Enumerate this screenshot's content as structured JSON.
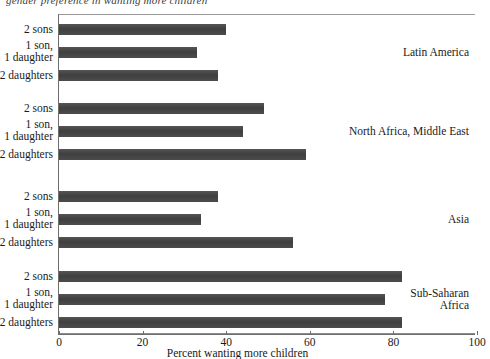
{
  "figure": {
    "top_caption": "gender preference in wanting more children",
    "x_axis_title": "Percent wanting more children",
    "x_ticks": [
      0,
      20,
      40,
      60,
      80,
      100
    ],
    "bar_color": "#4a4a4a",
    "frame_color": "#8c8c8c"
  },
  "chart_data": {
    "type": "bar",
    "orientation": "horizontal",
    "title": "",
    "xlabel": "Percent wanting more children",
    "ylabel": "",
    "xlim": [
      0,
      100
    ],
    "grid": false,
    "legend": "none",
    "categories": [
      "2 sons",
      "1 son,\n1 daughter",
      "2 daughters"
    ],
    "groups": [
      {
        "name": "Latin America",
        "label_lines": [
          "Latin America"
        ],
        "bars": [
          {
            "category": "2 sons",
            "label_lines": [
              "2 sons"
            ],
            "value": 40
          },
          {
            "category": "1 son, 1 daughter",
            "label_lines": [
              "1 son,",
              "1 daughter"
            ],
            "value": 33
          },
          {
            "category": "2 daughters",
            "label_lines": [
              "2 daughters"
            ],
            "value": 38
          }
        ]
      },
      {
        "name": "North Africa, Middle East",
        "label_lines": [
          "North Africa, Middle East"
        ],
        "bars": [
          {
            "category": "2 sons",
            "label_lines": [
              "2 sons"
            ],
            "value": 49
          },
          {
            "category": "1 son, 1 daughter",
            "label_lines": [
              "1 son,",
              "1 daughter"
            ],
            "value": 44
          },
          {
            "category": "2 daughters",
            "label_lines": [
              "2 daughters"
            ],
            "value": 59
          }
        ]
      },
      {
        "name": "Asia",
        "label_lines": [
          "Asia"
        ],
        "bars": [
          {
            "category": "2 sons",
            "label_lines": [
              "2 sons"
            ],
            "value": 38
          },
          {
            "category": "1 son, 1 daughter",
            "label_lines": [
              "1 son,",
              "1 daughter"
            ],
            "value": 34
          },
          {
            "category": "2 daughters",
            "label_lines": [
              "2 daughters"
            ],
            "value": 56
          }
        ]
      },
      {
        "name": "Sub-Saharan Africa",
        "label_lines": [
          "Sub-Saharan",
          "Africa"
        ],
        "bars": [
          {
            "category": "2 sons",
            "label_lines": [
              "2 sons"
            ],
            "value": 82
          },
          {
            "category": "1 son, 1 daughter",
            "label_lines": [
              "1 son,",
              "1 daughter"
            ],
            "value": 78
          },
          {
            "category": "2 daughters",
            "label_lines": [
              "2 daughters"
            ],
            "value": 82
          }
        ]
      }
    ]
  }
}
